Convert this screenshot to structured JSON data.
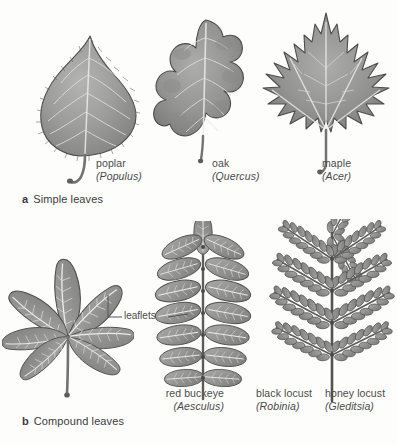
{
  "figure": {
    "panels": [
      {
        "key": "a",
        "caption": "Simple leaves",
        "specimens": [
          {
            "common": "poplar",
            "genus": "(Populus)",
            "icon": "poplar-leaf-icon"
          },
          {
            "common": "oak",
            "genus": "(Quercus)",
            "icon": "oak-leaf-icon"
          },
          {
            "common": "maple",
            "genus": "(Acer)",
            "icon": "maple-leaf-icon"
          }
        ]
      },
      {
        "key": "b",
        "caption": "Compound leaves",
        "specimens": [
          {
            "common": "red buckeye",
            "genus": "(Aesculus)",
            "icon": "red-buckeye-leaf-icon"
          },
          {
            "common": "black locust",
            "genus": "(Robinia)",
            "icon": "black-locust-leaf-icon"
          },
          {
            "common": "honey locust",
            "genus": "(Gleditsia)",
            "icon": "honey-locust-leaf-icon"
          }
        ]
      }
    ],
    "annotations": [
      {
        "text": "leaflets"
      }
    ]
  },
  "colors": {
    "background": "#fdfdfc",
    "text": "#4a4a4a",
    "leaf_fill": "#9a9a9a",
    "leaf_outline": "#4d4d4d",
    "vein": "#e8e8e6",
    "stem": "#70706d"
  }
}
